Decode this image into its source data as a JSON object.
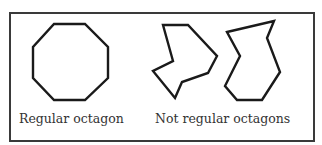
{
  "figure": {
    "regular": {
      "label": "Regular octagon",
      "points": "54,24 85,24 108,47 108,78 85,100 54,100 33,78 33,47"
    },
    "irregular": {
      "label": "Not regular octagons",
      "shapes": [
        {
          "points": "163,25 188,25 217,56 208,73 182,82 175,98 153,71 173,61"
        },
        {
          "points": "227,32 274,21 267,38 280,72 262,100 237,100 225,86 240,56"
        }
      ]
    },
    "colors": {
      "stroke": "#1a1a1a",
      "border": "#3a3a3a",
      "text": "#333333"
    }
  }
}
